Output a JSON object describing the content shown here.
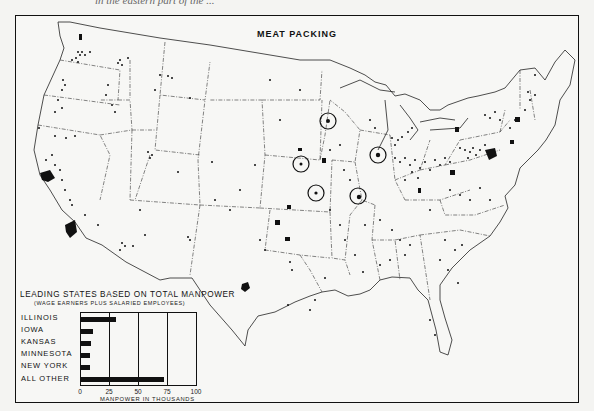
{
  "page": {
    "caption_fragment": "in the eastern part of the ...",
    "title": "MEAT PACKING"
  },
  "legend": {
    "title": "LEADING STATES BASED ON TOTAL MANPOWER",
    "subtitle": "(WAGE EARNERS PLUS SALARIED EMPLOYEES)",
    "xlabel": "MANPOWER IN THOUSANDS",
    "ticks": [
      "0",
      "25",
      "50",
      "75",
      "100"
    ],
    "rows": [
      {
        "label": "ILLINOIS",
        "value": 30
      },
      {
        "label": "IOWA",
        "value": 10
      },
      {
        "label": "KANSAS",
        "value": 9
      },
      {
        "label": "MINNESOTA",
        "value": 8
      },
      {
        "label": "NEW YORK",
        "value": 8
      },
      {
        "label": "ALL OTHER",
        "value": 72
      }
    ]
  },
  "map": {
    "circled_centers": [
      "Minneapolis-St. Paul",
      "Omaha",
      "Chicago",
      "Kansas City",
      "St. Louis"
    ],
    "symbol_legend": "dots = meat packing plants; solid shapes = concentrated areas"
  },
  "chart_data": {
    "type": "bar",
    "orientation": "horizontal",
    "title": "LEADING STATES BASED ON TOTAL MANPOWER",
    "subtitle": "(WAGE EARNERS PLUS SALARIED EMPLOYEES)",
    "categories": [
      "ILLINOIS",
      "IOWA",
      "KANSAS",
      "MINNESOTA",
      "NEW YORK",
      "ALL OTHER"
    ],
    "values": [
      30,
      10,
      9,
      8,
      8,
      72
    ],
    "xlabel": "MANPOWER IN THOUSANDS",
    "ylabel": "",
    "xlim": [
      0,
      100
    ],
    "xticks": [
      0,
      25,
      50,
      75,
      100
    ],
    "grid": true
  }
}
